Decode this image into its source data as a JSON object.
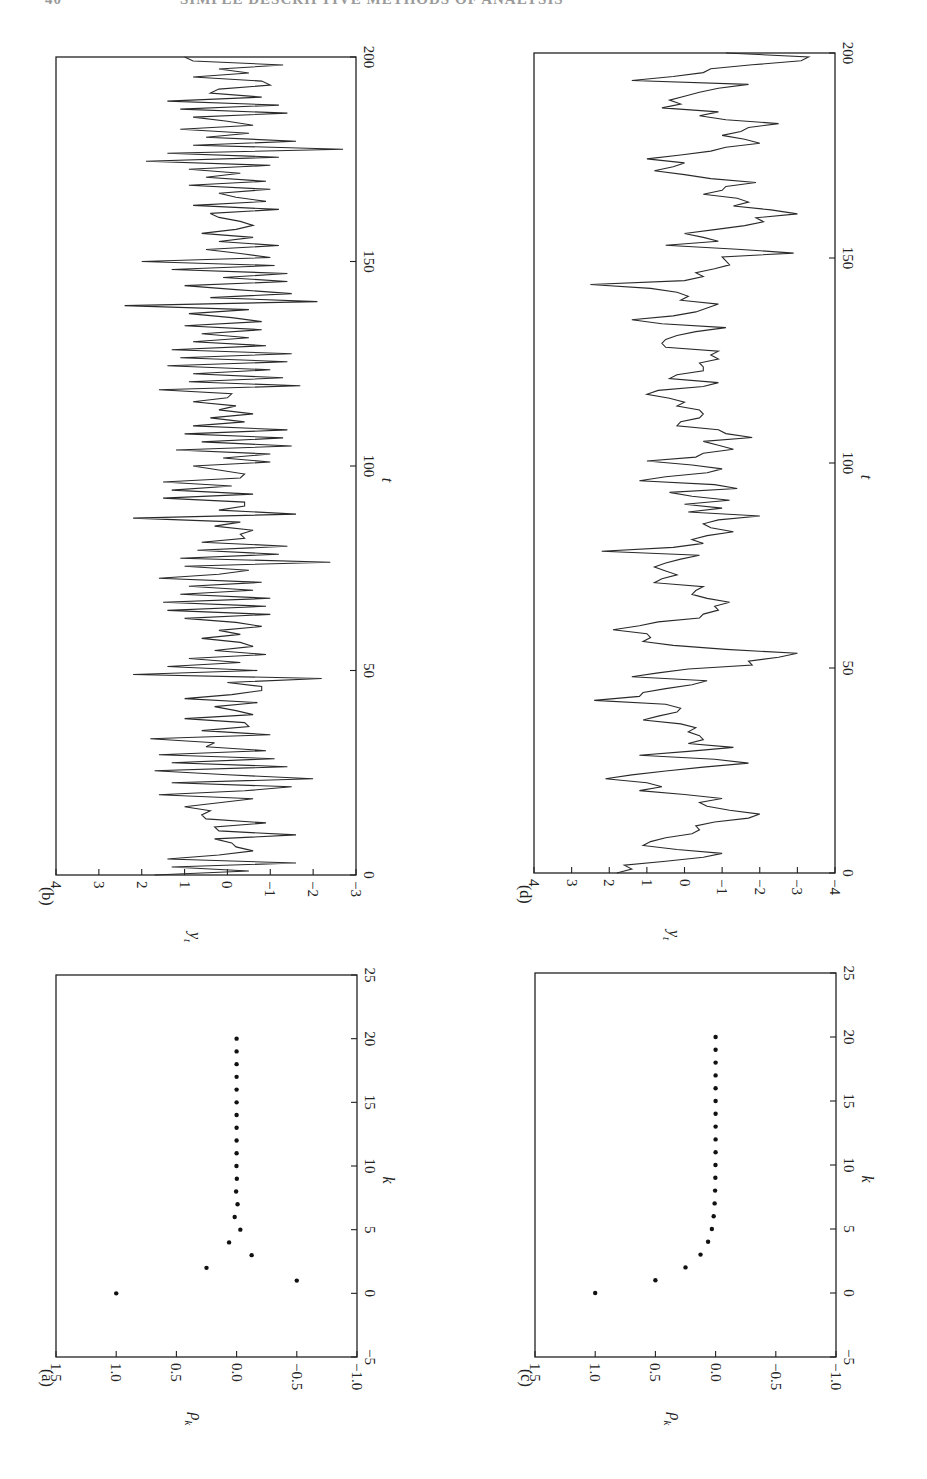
{
  "page": {
    "header_page_number": "40",
    "header_running_title": "SIMPLE DESCRIPTIVE METHODS OF ANALYSIS",
    "orientation": "figure rotated 90° counter-clockwise on page"
  },
  "chart_data": [
    {
      "id": "a",
      "panel_label": "(a)",
      "type": "scatter",
      "title": "",
      "xlabel": "k",
      "ylabel": "ρk",
      "xlim": [
        -5,
        25
      ],
      "ylim": [
        -1.0,
        1.5
      ],
      "xticks": [
        "−5",
        "0",
        "5",
        "10",
        "15",
        "20",
        "25"
      ],
      "yticks": [
        "−1.0",
        "−0.5",
        "0.0",
        "0.5",
        "1.0",
        "1.5"
      ],
      "x": [
        0,
        1,
        2,
        3,
        4,
        5,
        6,
        7,
        8,
        9,
        10,
        11,
        12,
        13,
        14,
        15,
        16,
        17,
        18,
        19,
        20
      ],
      "values": [
        1.0,
        -0.5,
        0.25,
        -0.125,
        0.0625,
        -0.031,
        0.016,
        -0.008,
        0.004,
        -0.002,
        0.001,
        0,
        0,
        0,
        0,
        0,
        0,
        0,
        0,
        0,
        0
      ],
      "grid": false
    },
    {
      "id": "b",
      "panel_label": "(b)",
      "type": "line",
      "title": "",
      "xlabel": "t",
      "ylabel": "yt",
      "xlim": [
        0,
        200
      ],
      "ylim": [
        -3,
        4
      ],
      "xticks": [
        "0",
        "50",
        "100",
        "150",
        "200"
      ],
      "yticks": [
        "−3",
        "−2",
        "−1",
        "0",
        "1",
        "2",
        "3",
        "4"
      ],
      "x_step": 1,
      "values": [
        1.7,
        -0.5,
        1.3,
        -1.6,
        1.4,
        0.2,
        -0.6,
        -0.2,
        -0.1,
        0.3,
        -1.6,
        0.2,
        0.3,
        -0.9,
        0.5,
        0.6,
        0.4,
        1.0,
        0.2,
        -0.6,
        1.6,
        -0.4,
        -1.5,
        1.3,
        -2.0,
        0.0,
        1.7,
        -1.4,
        1.3,
        -1.1,
        1.6,
        -0.9,
        0.5,
        0.3,
        1.8,
        -1.0,
        0.6,
        -0.5,
        -0.4,
        1.0,
        -0.6,
        -0.2,
        0.3,
        -0.7,
        1.0,
        -0.1,
        -0.8,
        -0.8,
        0.0,
        -2.2,
        2.2,
        -0.7,
        1.4,
        -0.3,
        0.9,
        -0.9,
        0.3,
        -0.6,
        -0.3,
        0.6,
        -0.3,
        0.2,
        -0.8,
        -0.2,
        1.0,
        -1.0,
        1.4,
        -0.9,
        1.5,
        -1.0,
        1.1,
        -0.6,
        0.9,
        -0.8,
        1.6,
        0.2,
        -0.5,
        1.0,
        -2.4,
        1.1,
        -1.2,
        0.7,
        -1.4,
        0.6,
        -0.4,
        -0.3,
        -0.6,
        0.3,
        -0.3,
        2.2,
        -1.6,
        0.2,
        -0.4,
        -0.4,
        1.5,
        -0.6,
        1.3,
        -0.1,
        1.5,
        -0.3,
        -0.4,
        0.2,
        0.8,
        -1.0,
        0.1,
        -1.0,
        1.2,
        -1.5,
        0.6,
        -1.3,
        1.0,
        -1.4,
        0.8,
        -0.4,
        0.4,
        -0.6,
        0.2,
        -0.2,
        0.8,
        0.0,
        -0.1,
        1.6,
        -1.7,
        0.9,
        -1.3,
        0.8,
        -1.0,
        1.4,
        -1.4,
        1.1,
        -1.5,
        1.3,
        -0.9,
        0.8,
        -0.5,
        0.6,
        -0.8,
        1.0,
        -0.8,
        -0.1,
        0.9,
        -0.5,
        2.4,
        -2.1,
        0.4,
        -1.5,
        -0.2,
        1.0,
        -1.4,
        0.1,
        -1.4,
        1.3,
        -1.1,
        2.0,
        -1.0,
        -0.3,
        0.5,
        -1.2,
        0.2,
        -0.6,
        0.6,
        -0.2,
        -0.6,
        -0.3,
        0.2,
        0.4,
        -1.2,
        0.8,
        -0.9,
        -0.2,
        0.2,
        -1.0,
        0.9,
        -0.9,
        0.5,
        -0.3,
        0.9,
        -1.0,
        1.9,
        -1.2,
        1.4,
        -2.7,
        0.8,
        -1.6,
        0.5,
        -0.5,
        1.1,
        -0.6,
        0.0,
        0.8,
        -1.4,
        1.1,
        -1.2,
        1.4,
        -0.8,
        0.4,
        0.2,
        -1.0,
        -0.8,
        0.8,
        -0.5,
        0.2,
        -1.3,
        0.8,
        1.0
      ],
      "grid": false
    },
    {
      "id": "c",
      "panel_label": "(c)",
      "type": "scatter",
      "title": "",
      "xlabel": "k",
      "ylabel": "ρk",
      "xlim": [
        -5,
        25
      ],
      "ylim": [
        -1.0,
        1.5
      ],
      "xticks": [
        "−5",
        "0",
        "5",
        "10",
        "15",
        "20",
        "25"
      ],
      "yticks": [
        "−1.0",
        "−0.5",
        "0.0",
        "0.5",
        "1.0",
        "1.5"
      ],
      "x": [
        0,
        1,
        2,
        3,
        4,
        5,
        6,
        7,
        8,
        9,
        10,
        11,
        12,
        13,
        14,
        15,
        16,
        17,
        18,
        19,
        20
      ],
      "values": [
        1.0,
        0.5,
        0.25,
        0.125,
        0.0625,
        0.031,
        0.016,
        0.008,
        0.004,
        0.002,
        0.001,
        0,
        0,
        0,
        0,
        0,
        0,
        0,
        0,
        0,
        0
      ],
      "grid": false
    },
    {
      "id": "d",
      "panel_label": "(d)",
      "type": "line",
      "title": "",
      "xlabel": "t",
      "ylabel": "yt",
      "xlim": [
        0,
        200
      ],
      "ylim": [
        -4,
        4
      ],
      "xticks": [
        "0",
        "50",
        "100",
        "150",
        "200"
      ],
      "yticks": [
        "−4",
        "−3",
        "−2",
        "−1",
        "0",
        "1",
        "2",
        "3",
        "4"
      ],
      "x_step": 1,
      "values": [
        1.8,
        1.4,
        1.6,
        0.5,
        -0.5,
        -1.0,
        0.2,
        1.1,
        0.9,
        0.5,
        -0.2,
        -0.4,
        -0.3,
        -0.8,
        -1.7,
        -2.0,
        -1.2,
        -0.6,
        -0.4,
        -1.0,
        0.0,
        1.2,
        0.6,
        1.0,
        2.1,
        1.4,
        0.5,
        -0.5,
        -1.7,
        -0.8,
        1.2,
        -0.1,
        -1.3,
        -0.1,
        -0.5,
        -0.4,
        -0.1,
        -0.3,
        0.1,
        1.1,
        0.7,
        0.2,
        0.1,
        0.5,
        2.4,
        1.2,
        1.1,
        0.5,
        -0.2,
        -0.6,
        1.4,
        0.7,
        -0.1,
        -1.8,
        -1.7,
        -2.5,
        -3.0,
        -1.1,
        0.3,
        1.1,
        0.9,
        1.0,
        1.9,
        1.2,
        0.7,
        -0.4,
        -0.5,
        -0.9,
        -0.8,
        -1.2,
        -0.6,
        -0.2,
        -0.3,
        -0.5,
        0.8,
        0.6,
        0.2,
        0.5,
        0.8,
        0.5,
        0.1,
        -0.4,
        2.2,
        0.3,
        -0.5,
        -0.2,
        -0.6,
        -1.3,
        -0.7,
        -0.5,
        -0.9,
        -2.0,
        -0.1,
        -1.0,
        0.0,
        -1.2,
        -0.2,
        0.4,
        -1.4,
        -0.8,
        1.2,
        0.5,
        -0.6,
        -1.0,
        -0.2,
        1.0,
        -0.3,
        -0.5,
        -1.3,
        -0.9,
        -0.5,
        -1.8,
        -1.1,
        -0.9,
        0.2,
        0.1,
        -0.4,
        -0.5,
        -0.4,
        0.2,
        0.0,
        0.4,
        1.0,
        0.7,
        -0.5,
        -0.9,
        0.4,
        0.2,
        -0.5,
        -0.5,
        -0.4,
        -0.9,
        -0.7,
        -0.9,
        0.5,
        0.6,
        0.5,
        0.2,
        -0.3,
        -1.1,
        0.6,
        1.4,
        0.3,
        -0.3,
        -0.6,
        -0.9,
        0.1,
        -0.1,
        0.2,
        0.9,
        2.5,
        0.0,
        -0.5,
        -0.3,
        -0.8,
        -1.2,
        -1.1,
        -1.0,
        -2.9,
        -1.4,
        0.5,
        -0.9,
        -0.5,
        0.0,
        -0.8,
        -1.6,
        -2.1,
        -1.9,
        -3.0,
        -2.3,
        -1.3,
        -1.7,
        -1.4,
        -0.5,
        -1.0,
        -1.1,
        -1.9,
        -0.7,
        0.0,
        0.8,
        0.3,
        0.0,
        1.0,
        0.1,
        -0.7,
        -1.1,
        -2.0,
        -1.6,
        -1.0,
        -1.5,
        -1.7,
        -2.5,
        -1.1,
        -0.4,
        -0.9,
        0.6,
        0.1,
        0.4,
        0.0,
        -0.4,
        -0.9,
        -1.7,
        1.4,
        0.3,
        -0.5,
        -0.7,
        -1.8,
        -3.1,
        -3.3,
        -1.1
      ],
      "grid": false
    }
  ]
}
